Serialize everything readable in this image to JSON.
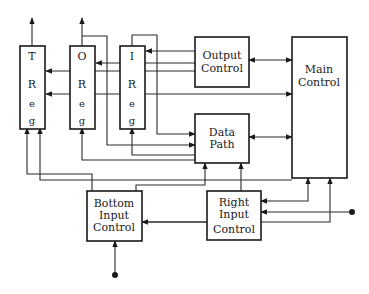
{
  "diagram": {
    "colors": {
      "line": "#1a1a1a",
      "background": "#ffffff"
    },
    "registers": [
      {
        "id": "t-reg",
        "letters": [
          "T",
          "R",
          "e",
          "g"
        ]
      },
      {
        "id": "o-reg",
        "letters": [
          "O",
          "R",
          "e",
          "g"
        ]
      },
      {
        "id": "i-reg",
        "letters": [
          "I",
          "R",
          "e",
          "g"
        ]
      }
    ],
    "blocks": {
      "output_control": {
        "line1": "Output",
        "line2": "Control"
      },
      "main_control": {
        "line1": "Main",
        "line2": "Control"
      },
      "data_path": {
        "line1": "Data",
        "line2": "Path"
      },
      "bottom_input_control": {
        "line1": "Bottom",
        "line2": "Input",
        "line3": "Control"
      },
      "right_input_control": {
        "line1": "Right",
        "line2": "Input",
        "line3": "Control"
      }
    },
    "external_inputs": [
      "right-input-terminal",
      "bottom-input-terminal"
    ]
  }
}
